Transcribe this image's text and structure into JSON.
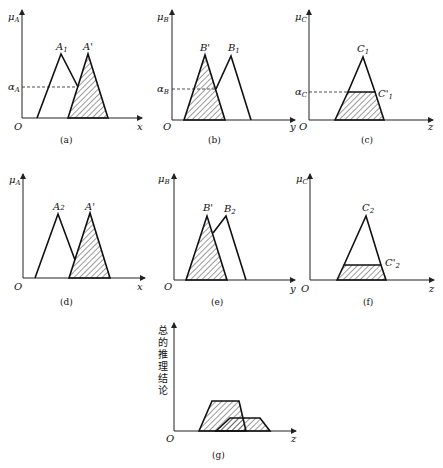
{
  "panels": {
    "a": {
      "caption": "(a)",
      "y_axis": "μ",
      "y_sub": "A",
      "x_axis": "x",
      "origin": "O",
      "level": "α",
      "level_sub": "A",
      "shape1": "A",
      "shape1_sub": "1",
      "shape2": "A'"
    },
    "b": {
      "caption": "(b)",
      "y_axis": "μ",
      "y_sub": "B",
      "x_axis": "y",
      "origin": "O",
      "level": "α",
      "level_sub": "B",
      "shape1": "B'",
      "shape2": "B",
      "shape2_sub": "1"
    },
    "c": {
      "caption": "(c)",
      "y_axis": "μ",
      "y_sub": "C",
      "x_axis": "z",
      "origin": "O",
      "level": "α",
      "level_sub": "C",
      "shape1": "C",
      "shape1_sub": "1",
      "shape2": "C'",
      "shape2_sub": "1"
    },
    "d": {
      "caption": "(d)",
      "y_axis": "μ",
      "y_sub": "A",
      "x_axis": "x",
      "origin": "O",
      "shape1": "A",
      "shape1_sub": "2",
      "shape2": "A'"
    },
    "e": {
      "caption": "(e)",
      "y_axis": "μ",
      "y_sub": "B",
      "x_axis": "y",
      "origin": "O",
      "shape1": "B'",
      "shape2": "B",
      "shape2_sub": "2"
    },
    "f": {
      "caption": "(f)",
      "y_axis": "μ",
      "y_sub": "C",
      "x_axis": "z",
      "origin": "O",
      "shape1": "C",
      "shape1_sub": "2",
      "shape2": "C'",
      "shape2_sub": "2"
    },
    "g": {
      "caption": "(g)",
      "y_axis_chars": [
        "总",
        "的",
        "推",
        "理",
        "结",
        "论"
      ],
      "x_axis": "z",
      "origin": "O"
    }
  }
}
